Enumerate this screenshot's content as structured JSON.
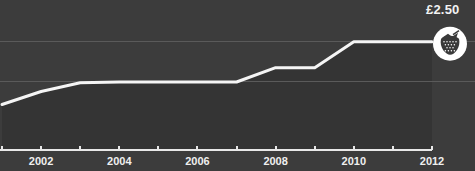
{
  "chart_data": {
    "type": "line",
    "title": "",
    "subtitle": "",
    "xlabel": "",
    "ylabel": "",
    "xlim": [
      2001,
      2012
    ],
    "ylim": [
      0,
      3.0
    ],
    "grid": true,
    "legend": "none",
    "currency": "£",
    "series": [
      {
        "name": "Strawberry price",
        "x": [
          2001,
          2002,
          2003,
          2004,
          2005,
          2006,
          2007,
          2008,
          2009,
          2010,
          2011,
          2012
        ],
        "values": [
          1.05,
          1.35,
          1.55,
          1.57,
          1.57,
          1.57,
          1.57,
          1.9,
          1.9,
          2.5,
          2.5,
          2.5
        ]
      }
    ],
    "gridlines": [
      {
        "value": 2.5,
        "style": "solid-faint"
      },
      {
        "value": 1.57,
        "style": "solid-faint"
      }
    ],
    "endpoint_annotation": {
      "label": "£2.50",
      "x": 2012,
      "y": 2.5,
      "marker": "strawberry-icon"
    },
    "xticks": [
      2001,
      2002,
      2003,
      2004,
      2005,
      2006,
      2007,
      2008,
      2009,
      2010,
      2011,
      2012
    ],
    "xtick_labels": [
      "",
      "2002",
      "",
      "2004",
      "",
      "2006",
      "",
      "2008",
      "",
      "2010",
      "",
      "2012"
    ],
    "colors": {
      "background": "#3c3c3c",
      "area_fill": "#343434",
      "line": "#f5f5f5",
      "grid": "#5a5a5a",
      "axis": "#e8e8e8",
      "text": "#efefef",
      "marker_bg": "#ffffff",
      "marker_fg": "#3a3a3a"
    }
  },
  "annotations": {
    "price_label": "£2.50"
  }
}
